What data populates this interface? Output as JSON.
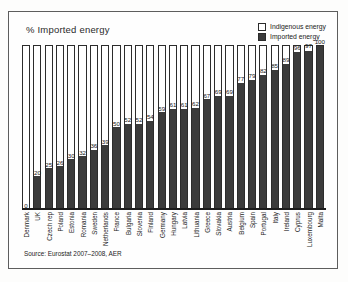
{
  "figure": {
    "title": "% Imported energy",
    "source": "Source: Eurostat 2007–2008, AER"
  },
  "legend": {
    "items": [
      {
        "label": "Indigenous energy",
        "swatch": "white"
      },
      {
        "label": "Imported energy",
        "swatch": "dark"
      }
    ]
  },
  "colors": {
    "imported": "#3b3b3b",
    "indigenous": "#ffffff",
    "outline": "#2c2c2c",
    "frame": "#5d5d5d",
    "text": "#1d1d1d"
  },
  "chart_data": {
    "type": "bar",
    "title": "% Imported energy",
    "xlabel": "",
    "ylabel": "% Imported energy",
    "ylim": [
      0,
      100
    ],
    "grid": false,
    "legend_position": "top-right",
    "stacked": true,
    "annotation": "Source: Eurostat 2007–2008, AER",
    "categories": [
      "Denmark",
      "UK",
      "Czech rep",
      "Poland",
      "Estonia",
      "Romania",
      "Sweden",
      "Netherlands",
      "France",
      "Bulgaria",
      "Slovenia",
      "Finland",
      "Germany",
      "Hungary",
      "Latvia",
      "Lithuania",
      "Greece",
      "Slovakia",
      "Austria",
      "Belgium",
      "Spain",
      "Portugal",
      "Italy",
      "Ireland",
      "Cyprus",
      "Luxembourg",
      "Malta"
    ],
    "series": [
      {
        "name": "Imported energy",
        "values": [
          0,
          20,
          25,
          26,
          30,
          32,
          36,
          39,
          50,
          52,
          52,
          54,
          59,
          61,
          61,
          62,
          67,
          69,
          69,
          77,
          79,
          82,
          85,
          89,
          96,
          97,
          100
        ]
      },
      {
        "name": "Indigenous energy",
        "values": [
          100,
          80,
          75,
          74,
          70,
          68,
          64,
          61,
          50,
          48,
          48,
          46,
          41,
          39,
          39,
          38,
          33,
          31,
          31,
          23,
          21,
          18,
          15,
          11,
          4,
          3,
          0
        ]
      }
    ],
    "data_labels": [
      "0",
      "20",
      "25",
      "26",
      "30",
      "32",
      "36",
      "39",
      "50",
      "52",
      "52",
      "54",
      "59",
      "61",
      "61",
      "62",
      "67",
      "69",
      "69",
      "77",
      "79",
      "82",
      "85",
      "89",
      "96",
      "97",
      "100"
    ]
  }
}
